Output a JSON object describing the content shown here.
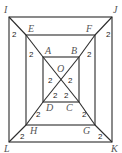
{
  "figure": {
    "squares": {
      "outer": [
        "I",
        "J",
        "K",
        "L"
      ],
      "middle": [
        "E",
        "F",
        "G",
        "H"
      ],
      "inner": [
        "A",
        "B",
        "C",
        "D"
      ]
    },
    "center_label": "O",
    "vertices": {
      "I": "I",
      "J": "J",
      "K": "K",
      "L": "L",
      "E": "E",
      "F": "F",
      "G": "G",
      "H": "H",
      "A": "A",
      "B": "B",
      "C": "C",
      "D": "D",
      "O": "O"
    },
    "segment_length_label": "2",
    "segment_labels": {
      "IE": "2",
      "EA": "2",
      "AO": "2",
      "JF": "2",
      "FB": "2",
      "BO": "2",
      "KG": "2",
      "GC": "2",
      "CO": "2",
      "LH": "2",
      "HD": "2",
      "DO": "2"
    },
    "line_color": "#2b2b2b",
    "label_color": "#555555"
  }
}
